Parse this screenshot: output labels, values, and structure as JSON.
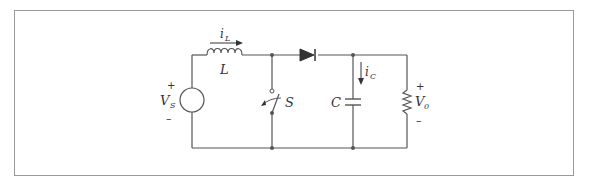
{
  "figure": {
    "type": "boost converter circuit schematic",
    "components": {
      "source": {
        "symbol": "V",
        "subscript": "S",
        "plus": "+",
        "minus": "–"
      },
      "inductor": {
        "symbol": "L",
        "current_symbol": "i",
        "current_subscript": "L"
      },
      "switch": {
        "symbol": "S"
      },
      "diode": {
        "symbol": ""
      },
      "capacitor": {
        "symbol": "C",
        "current_symbol": "i",
        "current_subscript": "C"
      },
      "load": {
        "symbol": "V",
        "subscript": "0",
        "plus": "+",
        "minus": "–"
      }
    },
    "colors": {
      "wire": "#555555",
      "text": "#333333",
      "frame": "#9a9a9a",
      "fill": "#333333"
    }
  }
}
